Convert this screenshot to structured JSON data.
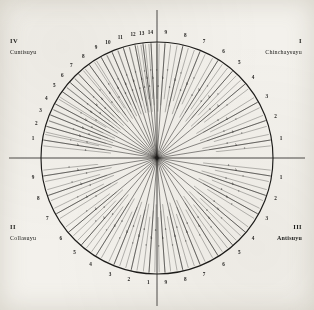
{
  "figure": {
    "center_label": "Coricancha",
    "ink_color": "#1d1c1a",
    "paper_color": "#f3f1ec",
    "geometry": {
      "cx": 157,
      "cy": 158,
      "radius": 116,
      "axis_overshoot": 32
    }
  },
  "quadrants": [
    {
      "roman": "I",
      "name": "Chinchaysuyu",
      "position": "top-right",
      "ceque_count": 9,
      "start_angle": -90,
      "end_angle": 0
    },
    {
      "roman": "II",
      "name": "Collasuyu",
      "position": "bottom-left",
      "ceque_count": 9,
      "start_angle": 90,
      "end_angle": 180
    },
    {
      "roman": "III",
      "name": "Antisuyu",
      "position": "bottom-right",
      "ceque_count": 9,
      "start_angle": 0,
      "end_angle": 90
    },
    {
      "roman": "IV",
      "name": "Cuntisuyu",
      "position": "top-left",
      "ceque_count": 14,
      "start_angle": 180,
      "end_angle": 270
    }
  ],
  "ray_sublabels": [
    "a",
    "b",
    "c"
  ],
  "ceque_numbers": {
    "chinchaysuyu": [
      "1",
      "2",
      "3",
      "4",
      "5",
      "6",
      "7",
      "8",
      "9"
    ],
    "antisuyu": [
      "1",
      "2",
      "3",
      "4",
      "5",
      "6",
      "7",
      "8",
      "9"
    ],
    "collasuyu": [
      "1",
      "2",
      "3",
      "4",
      "5",
      "6",
      "7",
      "8",
      "9"
    ],
    "cuntisuyu": [
      "1",
      "2",
      "3",
      "4",
      "5",
      "6",
      "7",
      "8",
      "9",
      "10",
      "11",
      "12",
      "13",
      "14"
    ]
  },
  "chart_data": {
    "type": "scatter",
    "xlabel": "",
    "ylabel": "",
    "grid": false,
    "legend_position": "corners",
    "axis_ranges": {
      "angle_deg": [
        0,
        360
      ],
      "radius": [
        0,
        116
      ]
    },
    "series": [
      {
        "name": "I Chinchaysuyu",
        "quadrant_roman": "I",
        "arc_from_deg": -90,
        "arc_to_deg": 0,
        "values": [
          {
            "ceque": "9",
            "angle": -86,
            "sub": [
              "a",
              "b",
              "c"
            ]
          },
          {
            "ceque": "8",
            "angle": -77,
            "sub": [
              "a",
              "b",
              "c"
            ]
          },
          {
            "ceque": "7",
            "angle": -68,
            "sub": [
              "a",
              "b",
              "c"
            ]
          },
          {
            "ceque": "6",
            "angle": -58,
            "sub": [
              "a",
              "b",
              "c"
            ]
          },
          {
            "ceque": "5",
            "angle": -49,
            "sub": [
              "a",
              "b",
              "c"
            ]
          },
          {
            "ceque": "4",
            "angle": -40,
            "sub": [
              "a",
              "b",
              "c"
            ]
          },
          {
            "ceque": "3",
            "angle": -29,
            "sub": [
              "a",
              "b",
              "c"
            ]
          },
          {
            "ceque": "2",
            "angle": -19,
            "sub": [
              "a",
              "b",
              "c"
            ]
          },
          {
            "ceque": "1",
            "angle": -9,
            "sub": [
              "a",
              "b",
              "c"
            ]
          }
        ]
      },
      {
        "name": "III Antisuyu",
        "quadrant_roman": "III",
        "arc_from_deg": 0,
        "arc_to_deg": 90,
        "values": [
          {
            "ceque": "1",
            "angle": 9,
            "sub": [
              "a",
              "b",
              "c"
            ]
          },
          {
            "ceque": "2",
            "angle": 19,
            "sub": [
              "a",
              "b",
              "c"
            ]
          },
          {
            "ceque": "3",
            "angle": 29,
            "sub": [
              "a",
              "b",
              "c"
            ]
          },
          {
            "ceque": "4",
            "angle": 40,
            "sub": [
              "a",
              "b",
              "c"
            ]
          },
          {
            "ceque": "5",
            "angle": 49,
            "sub": [
              "a",
              "b",
              "c"
            ]
          },
          {
            "ceque": "6",
            "angle": 58,
            "sub": [
              "a",
              "b",
              "c"
            ]
          },
          {
            "ceque": "7",
            "angle": 68,
            "sub": [
              "a",
              "b",
              "c"
            ]
          },
          {
            "ceque": "8",
            "angle": 77,
            "sub": [
              "a",
              "b",
              "c"
            ]
          },
          {
            "ceque": "9",
            "angle": 86,
            "sub": [
              "a",
              "b",
              "c"
            ]
          }
        ]
      },
      {
        "name": "II Collasuyu",
        "quadrant_roman": "II",
        "arc_from_deg": 90,
        "arc_to_deg": 180,
        "values": [
          {
            "ceque": "1",
            "angle": 94,
            "sub": [
              "a",
              "b",
              "c"
            ]
          },
          {
            "ceque": "2",
            "angle": 103,
            "sub": [
              "a",
              "b",
              "c"
            ]
          },
          {
            "ceque": "3",
            "angle": 112,
            "sub": [
              "a",
              "b",
              "c"
            ]
          },
          {
            "ceque": "4",
            "angle": 122,
            "sub": [
              "a",
              "b",
              "c"
            ]
          },
          {
            "ceque": "5",
            "angle": 131,
            "sub": [
              "a",
              "b",
              "c"
            ]
          },
          {
            "ceque": "6",
            "angle": 140,
            "sub": [
              "a",
              "b",
              "c"
            ]
          },
          {
            "ceque": "7",
            "angle": 151,
            "sub": [
              "a",
              "b",
              "c"
            ]
          },
          {
            "ceque": "8",
            "angle": 161,
            "sub": [
              "a",
              "b",
              "c"
            ]
          },
          {
            "ceque": "9",
            "angle": 171,
            "sub": [
              "a",
              "b",
              "c"
            ]
          }
        ]
      },
      {
        "name": "IV Cuntisuyu",
        "quadrant_roman": "IV",
        "arc_from_deg": 180,
        "arc_to_deg": 270,
        "values": [
          {
            "ceque": "1",
            "angle": -171,
            "sub": [
              "a",
              "b",
              "c"
            ]
          },
          {
            "ceque": "2",
            "angle": -164,
            "sub": [
              "a",
              "b",
              "c"
            ]
          },
          {
            "ceque": "3",
            "angle": -158,
            "sub": [
              "a",
              "b",
              "c"
            ]
          },
          {
            "ceque": "4",
            "angle": -152,
            "sub": [
              "a",
              "b",
              "c"
            ]
          },
          {
            "ceque": "5",
            "angle": -145,
            "sub": [
              "a",
              "b",
              "c"
            ]
          },
          {
            "ceque": "6",
            "angle": -139,
            "sub": [
              "a",
              "b",
              "c"
            ]
          },
          {
            "ceque": "7",
            "angle": -133,
            "sub": [
              "a",
              "b",
              "c"
            ]
          },
          {
            "ceque": "8",
            "angle": -126,
            "sub": [
              "a",
              "b",
              "c"
            ]
          },
          {
            "ceque": "9",
            "angle": -119,
            "sub": [
              "a",
              "b",
              "c"
            ]
          },
          {
            "ceque": "10",
            "angle": -113,
            "sub": [
              "a",
              "b",
              "c"
            ]
          },
          {
            "ceque": "11",
            "angle": -107,
            "sub": [
              "a",
              "b",
              "c"
            ]
          },
          {
            "ceque": "12",
            "angle": -101,
            "sub": [
              "a",
              "b",
              "c"
            ]
          },
          {
            "ceque": "13",
            "angle": -97,
            "sub": [
              "a",
              "b",
              "c"
            ]
          },
          {
            "ceque": "14",
            "angle": -93,
            "sub": [
              "a",
              "b",
              "c"
            ]
          }
        ]
      }
    ]
  }
}
